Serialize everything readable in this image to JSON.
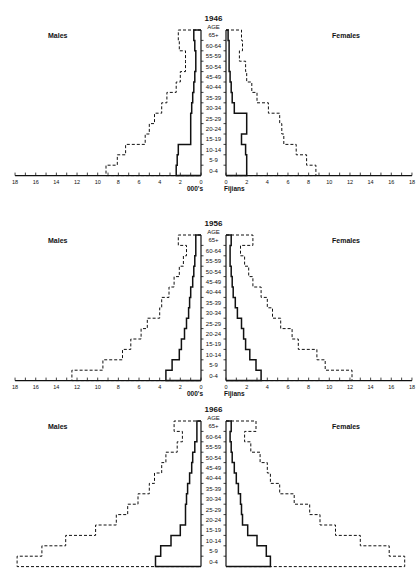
{
  "chart_data": [
    {
      "type": "bar",
      "subtype": "population-pyramid-step",
      "title": "1946",
      "center_label": "AGE",
      "left_label": "Males",
      "right_label": "Females",
      "xlabel_left": "000's",
      "xlabel_right": "Fijians",
      "xlim": [
        0,
        18
      ],
      "xticks": [
        0,
        2,
        4,
        6,
        8,
        10,
        12,
        14,
        16,
        18
      ],
      "categories": [
        "65+",
        "60-64",
        "55-59",
        "50-54",
        "45-49",
        "40-44",
        "35-39",
        "30-34",
        "25-29",
        "20-24",
        "15-19",
        "10-14",
        "5-9",
        "0-4"
      ],
      "series": [
        {
          "name": "Males (solid)",
          "side": "left",
          "style": "solid",
          "values": [
            0.7,
            0.6,
            0.5,
            0.5,
            0.6,
            0.7,
            0.8,
            0.9,
            1.0,
            1.0,
            1.0,
            2.2,
            2.3,
            2.4
          ]
        },
        {
          "name": "Males (dashed)",
          "side": "left",
          "style": "dashed",
          "values": [
            2.2,
            2.1,
            1.5,
            1.5,
            2.0,
            2.4,
            3.3,
            3.8,
            4.5,
            5.0,
            5.4,
            7.3,
            8.1,
            9.2
          ]
        },
        {
          "name": "Females (solid)",
          "side": "right",
          "style": "solid",
          "values": [
            0.2,
            0.3,
            0.3,
            0.3,
            0.4,
            0.5,
            0.6,
            0.8,
            2.0,
            2.0,
            1.5,
            1.9,
            2.0,
            2.0
          ]
        },
        {
          "name": "Females (dashed)",
          "side": "right",
          "style": "dashed",
          "values": [
            1.5,
            1.6,
            1.3,
            1.9,
            2.0,
            2.5,
            3.0,
            4.1,
            5.2,
            5.4,
            5.6,
            6.8,
            7.8,
            8.7
          ]
        }
      ],
      "grid": false,
      "legend": "none"
    },
    {
      "type": "bar",
      "subtype": "population-pyramid-step",
      "title": "1956",
      "center_label": "AGE",
      "left_label": "Males",
      "right_label": "Females",
      "xlabel_left": "000's",
      "xlabel_right": "Fijians",
      "xlim": [
        0,
        18
      ],
      "xticks": [
        0,
        2,
        4,
        6,
        8,
        10,
        12,
        14,
        16,
        18
      ],
      "categories": [
        "65+",
        "60-64",
        "55-59",
        "50-54",
        "45-49",
        "40-44",
        "35-39",
        "30-34",
        "25-29",
        "20-24",
        "15-19",
        "10-14",
        "5-9",
        "0-4"
      ],
      "series": [
        {
          "name": "Males (solid)",
          "side": "left",
          "style": "solid",
          "values": [
            0.5,
            0.5,
            0.6,
            0.7,
            0.8,
            1.0,
            1.1,
            1.2,
            1.4,
            1.6,
            1.9,
            2.1,
            2.8,
            3.4
          ]
        },
        {
          "name": "Males (dashed)",
          "side": "left",
          "style": "dashed",
          "values": [
            2.2,
            1.4,
            1.7,
            2.1,
            2.6,
            3.1,
            3.8,
            4.0,
            5.2,
            5.8,
            6.8,
            7.6,
            9.5,
            12.5
          ]
        },
        {
          "name": "Females (solid)",
          "side": "right",
          "style": "solid",
          "values": [
            0.5,
            0.4,
            0.4,
            0.5,
            0.6,
            0.7,
            0.9,
            1.1,
            1.5,
            1.7,
            1.9,
            2.3,
            2.9,
            3.4
          ]
        },
        {
          "name": "Females (dashed)",
          "side": "right",
          "style": "dashed",
          "values": [
            2.6,
            1.4,
            1.8,
            2.2,
            2.6,
            3.4,
            4.0,
            4.5,
            5.3,
            6.4,
            7.0,
            8.8,
            9.6,
            12.2
          ]
        }
      ],
      "grid": false,
      "legend": "none"
    },
    {
      "type": "bar",
      "subtype": "population-pyramid-step",
      "title": "1966",
      "center_label": "AGE",
      "left_label": "Males",
      "right_label": "Females",
      "xlim": [
        0,
        18
      ],
      "categories": [
        "65+",
        "60-64",
        "55-59",
        "50-54",
        "45-49",
        "40-44",
        "35-39",
        "30-34",
        "25-29",
        "20-24",
        "15-19",
        "10-14",
        "5-9",
        "0-4"
      ],
      "series": [
        {
          "name": "Males (solid)",
          "side": "left",
          "style": "solid",
          "values": [
            0.4,
            0.4,
            0.6,
            0.8,
            0.9,
            1.1,
            1.3,
            1.4,
            1.5,
            1.5,
            2.0,
            2.9,
            3.9,
            4.4
          ]
        },
        {
          "name": "Males (dashed)",
          "side": "left",
          "style": "dashed",
          "values": [
            2.6,
            1.8,
            2.3,
            3.4,
            3.8,
            4.5,
            5.0,
            6.1,
            7.1,
            8.2,
            10.2,
            13.1,
            15.4,
            17.8
          ]
        },
        {
          "name": "Females (solid)",
          "side": "right",
          "style": "solid",
          "values": [
            0.5,
            0.4,
            0.5,
            0.6,
            0.8,
            1.0,
            1.2,
            1.4,
            1.5,
            1.6,
            2.1,
            3.0,
            3.9,
            4.3
          ]
        },
        {
          "name": "Females (dashed)",
          "side": "right",
          "style": "dashed",
          "values": [
            2.9,
            1.8,
            2.4,
            3.3,
            4.0,
            4.3,
            5.2,
            6.6,
            8.1,
            9.1,
            10.6,
            13.0,
            15.8,
            17.3
          ]
        }
      ],
      "grid": false,
      "legend": "none"
    }
  ],
  "layout": {
    "panels": [
      {
        "top": 14,
        "row_top": 30,
        "row_h": 10.4,
        "show_axis": true
      },
      {
        "top": 202,
        "row_top": 235,
        "row_h": 10.4,
        "show_axis": true
      },
      {
        "top": 389,
        "row_top": 421,
        "row_h": 10.4,
        "show_axis": false
      }
    ],
    "left_zero_x": 201,
    "right_zero_x": 226,
    "unit_px": 10.33,
    "ink": "#111111"
  }
}
